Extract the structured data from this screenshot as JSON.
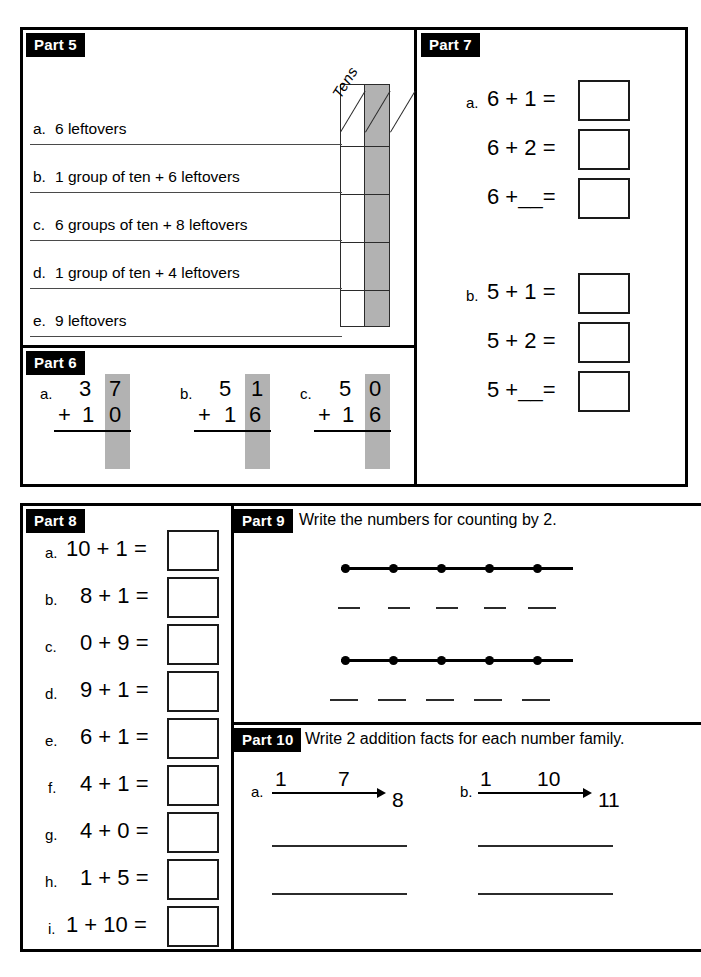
{
  "worksheet": {
    "shaded_color": "#b2b2b2",
    "ink_color": "#000000"
  },
  "part5": {
    "tag": "Part 5",
    "column_header": "Tens",
    "items": [
      {
        "letter": "a.",
        "text": "6 leftovers"
      },
      {
        "letter": "b.",
        "text": "1 group of ten + 6 leftovers"
      },
      {
        "letter": "c.",
        "text": "6 groups of ten + 8 leftovers"
      },
      {
        "letter": "d.",
        "text": "1 group of ten + 4 leftovers"
      },
      {
        "letter": "e.",
        "text": "9 leftovers"
      }
    ]
  },
  "part6": {
    "tag": "Part 6",
    "problems": [
      {
        "letter": "a.",
        "top_tens": "3",
        "top_ones": "7",
        "plus": "+",
        "bottom_tens": "1",
        "bottom_ones": "0"
      },
      {
        "letter": "b.",
        "top_tens": "5",
        "top_ones": "1",
        "plus": "+",
        "bottom_tens": "1",
        "bottom_ones": "6"
      },
      {
        "letter": "c.",
        "top_tens": "5",
        "top_ones": "0",
        "plus": "+",
        "bottom_tens": "1",
        "bottom_ones": "6"
      }
    ]
  },
  "part7": {
    "tag": "Part 7",
    "groups": [
      {
        "letter": "a.",
        "equations": [
          "6 + 1 =",
          "6 + 2 =",
          "6 +__="
        ]
      },
      {
        "letter": "b.",
        "equations": [
          "5 + 1 =",
          "5 + 2 =",
          "5 +__="
        ]
      }
    ]
  },
  "part8": {
    "tag": "Part 8",
    "items": [
      {
        "letter": "a.",
        "equation": "10 + 1 ="
      },
      {
        "letter": "b.",
        "equation": "8 + 1 ="
      },
      {
        "letter": "c.",
        "equation": "0 + 9 ="
      },
      {
        "letter": "d.",
        "equation": "9 + 1 ="
      },
      {
        "letter": "e.",
        "equation": "6 + 1 ="
      },
      {
        "letter": "f.",
        "equation": "4 + 1 ="
      },
      {
        "letter": "g.",
        "equation": "4 + 0 ="
      },
      {
        "letter": "h.",
        "equation": "1 + 5 ="
      },
      {
        "letter": "i.",
        "equation": "1 + 10 ="
      }
    ]
  },
  "part9": {
    "tag": "Part 9",
    "instruction": "Write the numbers for counting by 2.",
    "number_lines": [
      {
        "dot_count": 5,
        "blank_count": 5
      },
      {
        "dot_count": 5,
        "blank_count": 5
      }
    ]
  },
  "part10": {
    "tag": "Part 10",
    "instruction": "Write 2 addition facts for each number family.",
    "families": [
      {
        "letter": "a.",
        "small": "1",
        "large": "7",
        "total": "8",
        "answer_lines": 2
      },
      {
        "letter": "b.",
        "small": "1",
        "large": "10",
        "total": "11",
        "answer_lines": 2
      }
    ]
  }
}
